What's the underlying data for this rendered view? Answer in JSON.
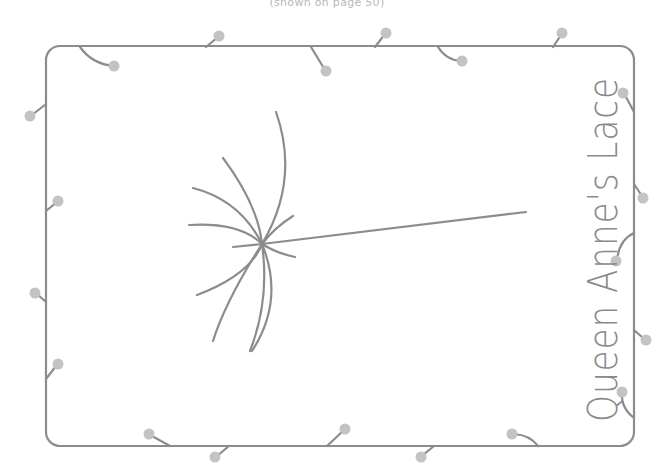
{
  "caption": "(shown on page 50)",
  "label": "Queen Anne's Lace",
  "colors": {
    "line": "#8c8c8c",
    "dot": "#c3c3c3",
    "caption": "#b9b9b9",
    "background": "#ffffff"
  },
  "border": {
    "decoration": "stitched border with pin-dots"
  },
  "flower": {
    "type": "umbel",
    "spokes": 9
  }
}
